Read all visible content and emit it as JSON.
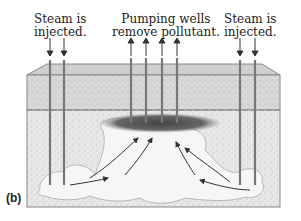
{
  "labels": {
    "left": [
      "Steam is",
      "injected."
    ],
    "middle": [
      "Pumping wells",
      "remove pollutant."
    ],
    "right": [
      "Steam is",
      "injected."
    ]
  },
  "panel_label": "(b)",
  "colors": {
    "soil_top": "#c9c9c9",
    "soil_body": "#e6e6e6",
    "pipe": "#777777",
    "pollutant": "#555555",
    "steam": "#f7f7f7",
    "arrow": "#333333",
    "water_table": "#888888"
  },
  "elements": {
    "injection_wells_left": 2,
    "pumping_wells": 4,
    "injection_wells_right": 2
  }
}
